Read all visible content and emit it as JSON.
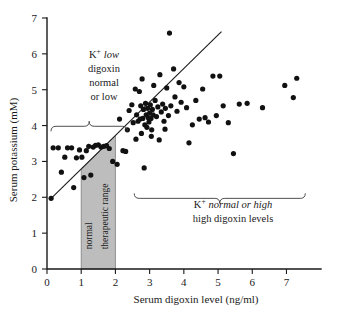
{
  "chart_data": {
    "type": "scatter",
    "title": "",
    "xlabel": "Serum digoxin level (ng/ml)",
    "ylabel": "Serum potassium (mM)",
    "xlim": [
      0,
      7.6
    ],
    "ylim": [
      0,
      7
    ],
    "xticks": [
      0,
      1,
      2,
      3,
      4,
      5,
      6,
      7
    ],
    "xtick_labels": [
      "0",
      "1",
      "2",
      "3",
      "4",
      "5",
      "6",
      "7"
    ],
    "yticks": [
      0,
      1,
      2,
      3,
      4,
      5,
      6,
      7
    ],
    "ytick_labels": [
      "0",
      "1",
      "2",
      "3",
      "4",
      "5",
      "6",
      "7"
    ],
    "grid": false,
    "legend": "none",
    "marker": "filled-circle",
    "marker_color": "#111111",
    "points": [
      [
        0.12,
        1.97
      ],
      [
        0.18,
        3.38
      ],
      [
        0.33,
        3.38
      ],
      [
        0.42,
        2.7
      ],
      [
        0.52,
        3.12
      ],
      [
        0.6,
        3.38
      ],
      [
        0.72,
        3.38
      ],
      [
        0.78,
        2.27
      ],
      [
        0.86,
        3.1
      ],
      [
        0.95,
        3.32
      ],
      [
        1.02,
        3.12
      ],
      [
        1.08,
        2.55
      ],
      [
        1.15,
        3.3
      ],
      [
        1.22,
        3.42
      ],
      [
        1.28,
        2.62
      ],
      [
        1.35,
        3.4
      ],
      [
        1.42,
        3.45
      ],
      [
        1.5,
        3.46
      ],
      [
        1.58,
        3.4
      ],
      [
        1.66,
        3.42
      ],
      [
        1.74,
        3.44
      ],
      [
        1.82,
        3.36
      ],
      [
        1.92,
        3.0
      ],
      [
        2.05,
        2.92
      ],
      [
        2.22,
        3.3
      ],
      [
        2.4,
        4.42
      ],
      [
        2.48,
        4.58
      ],
      [
        2.52,
        4.08
      ],
      [
        2.58,
        5.02
      ],
      [
        2.62,
        4.3
      ],
      [
        2.66,
        4.12
      ],
      [
        2.7,
        4.95
      ],
      [
        2.72,
        4.18
      ],
      [
        2.74,
        4.55
      ],
      [
        2.76,
        3.78
      ],
      [
        2.78,
        5.3
      ],
      [
        2.8,
        4.2
      ],
      [
        2.82,
        4.45
      ],
      [
        2.84,
        2.82
      ],
      [
        2.86,
        4.02
      ],
      [
        2.88,
        4.62
      ],
      [
        2.9,
        4.3
      ],
      [
        2.92,
        3.95
      ],
      [
        2.94,
        4.48
      ],
      [
        2.96,
        4.22
      ],
      [
        2.98,
        4.1
      ],
      [
        3.0,
        4.35
      ],
      [
        3.02,
        4.58
      ],
      [
        3.04,
        4.2
      ],
      [
        3.06,
        3.88
      ],
      [
        3.08,
        4.45
      ],
      [
        3.1,
        4.3
      ],
      [
        3.12,
        5.12
      ],
      [
        3.16,
        4.7
      ],
      [
        3.2,
        4.25
      ],
      [
        3.24,
        4.52
      ],
      [
        3.28,
        3.6
      ],
      [
        3.3,
        5.42
      ],
      [
        3.34,
        4.38
      ],
      [
        3.38,
        4.6
      ],
      [
        3.42,
        4.12
      ],
      [
        3.46,
        4.48
      ],
      [
        3.5,
        5.05
      ],
      [
        3.55,
        4.28
      ],
      [
        3.58,
        6.58
      ],
      [
        3.62,
        4.55
      ],
      [
        3.7,
        5.58
      ],
      [
        3.74,
        4.8
      ],
      [
        3.8,
        4.4
      ],
      [
        3.86,
        5.2
      ],
      [
        3.92,
        4.65
      ],
      [
        4.0,
        5.08
      ],
      [
        4.08,
        4.5
      ],
      [
        4.15,
        3.52
      ],
      [
        4.25,
        4.02
      ],
      [
        4.35,
        4.7
      ],
      [
        4.45,
        4.18
      ],
      [
        4.55,
        5.02
      ],
      [
        4.62,
        4.22
      ],
      [
        4.72,
        4.1
      ],
      [
        4.85,
        5.38
      ],
      [
        5.05,
        5.38
      ],
      [
        5.15,
        4.55
      ],
      [
        5.3,
        4.08
      ],
      [
        5.45,
        3.22
      ],
      [
        5.62,
        4.6
      ],
      [
        5.85,
        4.62
      ],
      [
        6.3,
        4.5
      ],
      [
        6.95,
        5.12
      ],
      [
        7.2,
        4.78
      ],
      [
        7.3,
        5.32
      ],
      [
        2.3,
        3.28
      ],
      [
        2.12,
        4.18
      ],
      [
        2.35,
        3.88
      ],
      [
        3.45,
        3.9
      ],
      [
        3.05,
        3.7
      ],
      [
        2.6,
        3.62
      ],
      [
        4.95,
        4.28
      ]
    ],
    "trend_line": {
      "label": "regression-line",
      "x0": 0.1,
      "y0": 1.95,
      "x1": 5.1,
      "y1": 6.62
    },
    "shaded_region": {
      "label": "normal therapeutic range",
      "label_lines": [
        "normal",
        "therapeutic range"
      ],
      "x_start": 1.0,
      "x_end": 2.0,
      "y_start": 0,
      "y_end_at_x_start": 2.78,
      "y_end_at_x_end": 3.72,
      "fill": "#bdbdbd"
    },
    "annotations": [
      {
        "name": "left-brace-annotation",
        "lines": [
          "K+ low",
          "digoxin",
          "normal",
          "or low"
        ],
        "italic_lines": [
          0
        ],
        "brace_x_start": 0.0,
        "brace_x_end": 2.35
      },
      {
        "name": "right-brace-annotation",
        "lines": [
          "K+ normal or high",
          "high digoxin levels"
        ],
        "italic_lines": [
          0
        ],
        "brace_x_start": 2.55,
        "brace_x_end": 7.55
      }
    ]
  },
  "axes": {
    "x_title": "Serum digoxin level (ng/ml)",
    "y_title": "Serum potassium (mM)"
  },
  "left_annotation": {
    "line1_prefix": "K",
    "line1_sup": "+",
    "line1_italic": "low",
    "line2": "digoxin",
    "line3": "normal",
    "line4": "or low"
  },
  "right_annotation": {
    "line1_prefix": "K",
    "line1_sup": "+",
    "line1_italic": "normal or high",
    "line2": "high digoxin levels"
  },
  "shade_label": {
    "line1": "normal",
    "line2": "therapeutic range"
  },
  "colors": {
    "marker": "#111111",
    "axis": "#1a1a1a",
    "shade_fill": "#bdbdbd",
    "brace": "#3c3c3c"
  }
}
